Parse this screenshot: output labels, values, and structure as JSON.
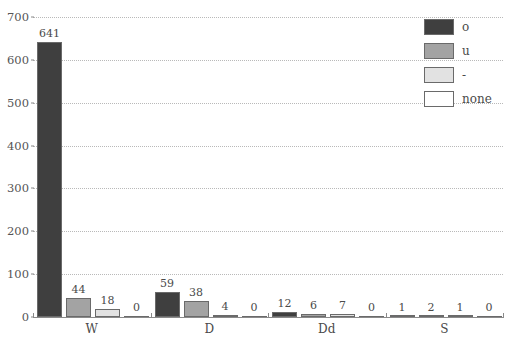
{
  "chart_data": {
    "type": "bar",
    "title": "",
    "subtitle": "",
    "xlabel": "",
    "ylabel": "",
    "categories": [
      "W",
      "D",
      "Dd",
      "S"
    ],
    "series": [
      {
        "name": "o",
        "color": "#3f3f3f",
        "values": [
          641,
          44,
          18,
          1
        ]
      },
      {
        "name": "u",
        "color": "#a3a3a3",
        "values": [
          44,
          38,
          6,
          2
        ]
      },
      {
        "name": "-",
        "color": "#e2e2e2",
        "values": [
          18,
          4,
          7,
          1
        ]
      },
      {
        "name": "none",
        "color": "#ffffff",
        "values": [
          0,
          0,
          0,
          0
        ]
      }
    ],
    "groups": [
      {
        "category": "W",
        "bars": [
          {
            "series": "o",
            "value": 641,
            "label": "641"
          },
          {
            "series": "u",
            "value": 44,
            "label": "44"
          },
          {
            "series": "-",
            "value": 18,
            "label": "18"
          },
          {
            "series": "none",
            "value": 0,
            "label": "0"
          }
        ]
      },
      {
        "category": "D",
        "bars": [
          {
            "series": "o",
            "value": 59,
            "label": "59"
          },
          {
            "series": "u",
            "value": 38,
            "label": "38"
          },
          {
            "series": "-",
            "value": 4,
            "label": "4"
          },
          {
            "series": "none",
            "value": 0,
            "label": "0"
          }
        ]
      },
      {
        "category": "Dd",
        "bars": [
          {
            "series": "o",
            "value": 12,
            "label": "12"
          },
          {
            "series": "u",
            "value": 6,
            "label": "6"
          },
          {
            "series": "-",
            "value": 7,
            "label": "7"
          },
          {
            "series": "none",
            "value": 0,
            "label": "0"
          }
        ]
      },
      {
        "category": "S",
        "bars": [
          {
            "series": "o",
            "value": 1,
            "label": "1"
          },
          {
            "series": "u",
            "value": 2,
            "label": "2"
          },
          {
            "series": "-",
            "value": 1,
            "label": "1"
          },
          {
            "series": "none",
            "value": 0,
            "label": "0"
          }
        ]
      }
    ],
    "ylim": [
      0,
      700
    ],
    "yticks": [
      0,
      100,
      200,
      300,
      400,
      500,
      600,
      700
    ],
    "ytick_labels": [
      "0",
      "100",
      "200",
      "300",
      "400",
      "500",
      "600",
      "700"
    ],
    "grid": true,
    "grid_style": "dotted",
    "grid_color": "#b9b9b9",
    "legend_position": "top-right",
    "legend": [
      {
        "label": "o",
        "color": "#3f3f3f"
      },
      {
        "label": "u",
        "color": "#a3a3a3"
      },
      {
        "label": "-",
        "color": "#e2e2e2"
      },
      {
        "label": "none",
        "color": "#ffffff"
      }
    ],
    "bar_border_color": "#6a6a6a",
    "axis_color": "#8a8a8a"
  }
}
